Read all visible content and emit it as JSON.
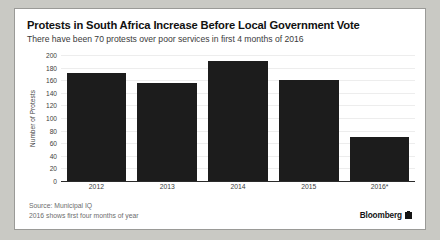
{
  "title": "Protests in South Africa Increase Before Local Government Vote",
  "subtitle": "There have been 70 protests over poor services in first 4 months of 2016",
  "footnotes": {
    "source": "Source: Municipal IQ",
    "note": "2016 shows first four months of year"
  },
  "brand": {
    "name": "Bloomberg",
    "mark": "bloomberg-logo-icon"
  },
  "chart_data": {
    "type": "bar",
    "title": "Protests in South Africa Increase Before Local Government Vote",
    "subtitle": "There have been 70 protests over poor services in first 4 months of 2016",
    "xlabel": "",
    "ylabel": "Number of Protests",
    "categories": [
      "2012",
      "2013",
      "2014",
      "2015",
      "2016*"
    ],
    "values": [
      172,
      155,
      191,
      160,
      70
    ],
    "ylim": [
      0,
      200
    ],
    "yticks": [
      0,
      20,
      40,
      60,
      80,
      100,
      120,
      140,
      160,
      180,
      200
    ],
    "grid": true,
    "legend": false,
    "bar_color": "#1c1c1c"
  }
}
